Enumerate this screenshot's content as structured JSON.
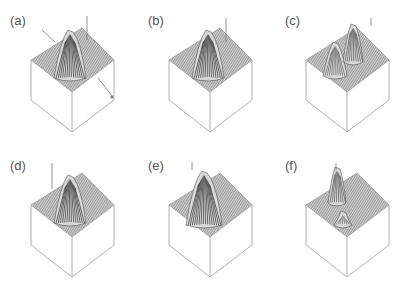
{
  "figure": {
    "panels": [
      {
        "label": "(a)",
        "left": 0,
        "top": 0,
        "peak": "single-tall",
        "has_cut_line": true
      },
      {
        "label": "(b)",
        "left": 138,
        "top": 0,
        "peak": "single-tall",
        "has_cut_line": false
      },
      {
        "label": "(c)",
        "left": 275,
        "top": 0,
        "peak": "double-ridge",
        "has_cut_line": false
      },
      {
        "label": "(d)",
        "left": 0,
        "top": 145,
        "peak": "single-tall",
        "has_cut_line": false
      },
      {
        "label": "(e)",
        "left": 138,
        "top": 145,
        "peak": "single-tall-edge",
        "has_cut_line": false
      },
      {
        "label": "(f)",
        "left": 275,
        "top": 145,
        "peak": "split-peaks",
        "has_cut_line": false
      }
    ],
    "colors": {
      "mesh": "#8a8a8a",
      "box": "#9a9a9a",
      "peak": "#333333",
      "label": "#555555"
    }
  }
}
